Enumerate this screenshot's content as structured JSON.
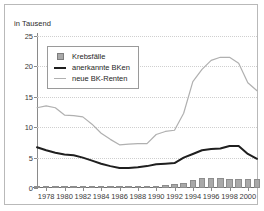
{
  "chart_data": {
    "type": "line",
    "title": "",
    "unit_label": "in Tausend",
    "xlabel": "",
    "ylabel": "",
    "ylim": [
      0,
      25
    ],
    "yticks": [
      0,
      5,
      10,
      15,
      20,
      25
    ],
    "grid": true,
    "legend_position": "top-left",
    "x": [
      1977,
      1978,
      1979,
      1980,
      1981,
      1982,
      1983,
      1984,
      1985,
      1986,
      1987,
      1988,
      1989,
      1990,
      1991,
      1992,
      1993,
      1994,
      1995,
      1996,
      1997,
      1998,
      1999,
      2000,
      2001
    ],
    "xtick_labels": [
      "1978",
      "1980",
      "1982",
      "1984",
      "1986",
      "1988",
      "1990",
      "1992",
      "1994",
      "1996",
      "1998",
      "2000"
    ],
    "xticks": [
      1978,
      1980,
      1982,
      1984,
      1986,
      1988,
      1990,
      1992,
      1994,
      1996,
      1998,
      2000
    ],
    "series": [
      {
        "name": "Krebsfälle",
        "type": "bar",
        "color": "#a9a9a9",
        "values": [
          0.05,
          0.05,
          0.06,
          0.06,
          0.07,
          0.08,
          0.09,
          0.1,
          0.12,
          0.15,
          0.2,
          0.28,
          0.35,
          0.4,
          0.45,
          0.6,
          0.85,
          1.25,
          1.65,
          1.7,
          1.7,
          1.55,
          1.55,
          1.5,
          1.5
        ]
      },
      {
        "name": "anerkannte BKen",
        "type": "line",
        "color": "#1f1f1f",
        "values": [
          6.7,
          6.2,
          5.8,
          5.5,
          5.4,
          5.0,
          4.5,
          4.0,
          3.6,
          3.3,
          3.3,
          3.4,
          3.6,
          3.9,
          4.0,
          4.1,
          5.0,
          5.6,
          6.2,
          6.4,
          6.5,
          6.9,
          6.9,
          5.6,
          4.8
        ]
      },
      {
        "name": "neue BK-Renten",
        "type": "line",
        "color": "#b0b0b0",
        "values": [
          13.2,
          13.5,
          13.2,
          12.0,
          11.9,
          11.7,
          10.5,
          9.0,
          8.0,
          7.1,
          7.2,
          7.3,
          7.3,
          8.8,
          9.3,
          9.5,
          12.3,
          17.5,
          19.5,
          21.0,
          21.5,
          21.5,
          20.5,
          17.3,
          16.0
        ]
      }
    ]
  },
  "legend": {
    "items": [
      {
        "label": "Krebsfälle",
        "key": "swatch-box"
      },
      {
        "label": "anerkannte BKen",
        "key": "swatch-dark"
      },
      {
        "label": "neue BK-Renten",
        "key": "swatch-light"
      }
    ]
  }
}
